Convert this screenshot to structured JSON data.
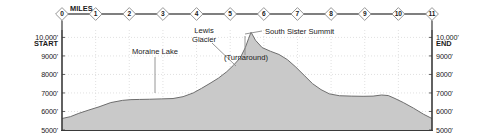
{
  "chart_data": {
    "type": "area",
    "title": "",
    "xlabel": "MILES",
    "ylabel": "",
    "xlim": [
      0,
      11
    ],
    "ylim": [
      5000,
      10400
    ],
    "grid": true,
    "legend_position": "none",
    "x_tick_labels": [
      "0",
      "1",
      "2",
      "3",
      "4",
      "5",
      "6",
      "7",
      "8",
      "9",
      "10",
      "11"
    ],
    "x_ticks": [
      0,
      1,
      2,
      3,
      4,
      5,
      6,
      7,
      8,
      9,
      10,
      11
    ],
    "y_tick_labels": [
      "10,000'",
      "9000'",
      "8000'",
      "7000'",
      "6000'",
      "5000'"
    ],
    "y_ticks": [
      10000,
      9000,
      8000,
      7000,
      6000,
      5000
    ],
    "series": [
      {
        "name": "Elevation",
        "x": [
          0.0,
          0.25,
          0.5,
          0.8,
          1.1,
          1.45,
          1.8,
          2.05,
          2.3,
          2.6,
          2.95,
          3.3,
          3.6,
          3.9,
          4.15,
          4.4,
          4.65,
          4.9,
          5.1,
          5.3,
          5.45,
          5.55,
          5.62,
          5.75,
          5.95,
          6.2,
          6.45,
          6.7,
          6.95,
          7.2,
          7.45,
          7.7,
          7.95,
          8.25,
          8.6,
          8.95,
          9.25,
          9.5,
          9.7,
          9.9,
          10.15,
          10.45,
          10.75,
          11.0
        ],
        "y": [
          5620,
          5720,
          5900,
          6080,
          6250,
          6480,
          6600,
          6640,
          6650,
          6660,
          6680,
          6700,
          6800,
          7000,
          7250,
          7520,
          7800,
          8150,
          8500,
          8900,
          9450,
          9950,
          10280,
          9850,
          9450,
          9250,
          9080,
          8800,
          8400,
          7950,
          7500,
          7180,
          6950,
          6850,
          6830,
          6820,
          6830,
          6890,
          6860,
          6700,
          6480,
          6180,
          5850,
          5620
        ]
      }
    ],
    "annotations": [
      {
        "name": "start-label",
        "text": "START",
        "x": 0,
        "y": 9550
      },
      {
        "name": "end-label",
        "text": "END",
        "x": 11,
        "y": 9550
      },
      {
        "name": "moraine-lake",
        "text": "Moraine Lake",
        "x": 2.45,
        "y": 9150
      },
      {
        "name": "lewis-glacier-line1",
        "text": "Lewis",
        "x": 4.0,
        "y": 10120
      },
      {
        "name": "lewis-glacier-line2",
        "text": "Glacier",
        "x": 4.0,
        "y": 9800
      },
      {
        "name": "south-sister-summit",
        "text": "South Sister Summit",
        "x": 6.3,
        "y": 10260
      },
      {
        "name": "turnaround",
        "text": "(Turnaround)",
        "x": 5.55,
        "y": 9020
      }
    ],
    "colors": {
      "fill": "#c9c9c9",
      "profile_line": "#6e6e6e",
      "axis": "#3a3a3a",
      "grid": "#d9d9d9",
      "text": "#1a1a1a",
      "baseline_band": "#c9c9c9",
      "mile_marker_fill": "#ffffff",
      "mile_marker_stroke": "#8a8a8a",
      "mile_axis_line": "#555555"
    }
  },
  "axis_top": {
    "miles_word": "MILES"
  },
  "left_axis": {
    "top_label": "10,000'",
    "start_label": "START"
  },
  "right_axis": {
    "top_label": "10,000'",
    "end_label": "END"
  }
}
